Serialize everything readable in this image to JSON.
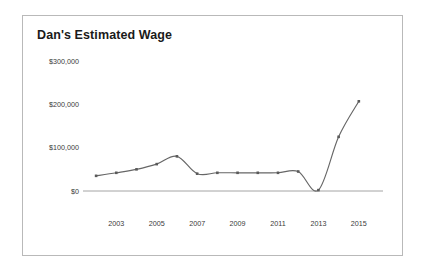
{
  "card": {
    "title": "Dan's Estimated Wage",
    "border_color": "#b9b9b9",
    "background": "#ffffff"
  },
  "chart_data": {
    "type": "line",
    "title": "Dan's Estimated Wage",
    "xlabel": "",
    "ylabel": "",
    "x": [
      2002,
      2003,
      2004,
      2005,
      2006,
      2007,
      2008,
      2009,
      2010,
      2011,
      2012,
      2013,
      2014,
      2015
    ],
    "categories": [
      "2002",
      "2003",
      "2004",
      "2005",
      "2006",
      "2007",
      "2008",
      "2009",
      "2010",
      "2011",
      "2012",
      "2013",
      "2014",
      "2015"
    ],
    "values": [
      35000,
      42000,
      50000,
      62000,
      80000,
      40000,
      42000,
      42000,
      42000,
      42000,
      45000,
      2000,
      125000,
      207000
    ],
    "series": [
      {
        "name": "Estimated Wage",
        "color": "#666666",
        "values": [
          35000,
          42000,
          50000,
          62000,
          80000,
          40000,
          42000,
          42000,
          42000,
          42000,
          45000,
          2000,
          125000,
          207000
        ]
      }
    ],
    "ylim": [
      0,
      300000
    ],
    "yticks": [
      0,
      100000,
      200000,
      300000
    ],
    "ytick_labels": [
      "$0",
      "$100,000",
      "$200,000",
      "$300,000"
    ],
    "xticks": [
      2003,
      2005,
      2007,
      2009,
      2011,
      2013,
      2015
    ],
    "xtick_labels": [
      "2003",
      "2005",
      "2007",
      "2009",
      "2011",
      "2013",
      "2015"
    ],
    "xlim": [
      2001.5,
      2015.8
    ],
    "grid": false,
    "legend": "none",
    "marker": "square",
    "line_color": "#666666",
    "axis_color": "#9a9a9a"
  }
}
